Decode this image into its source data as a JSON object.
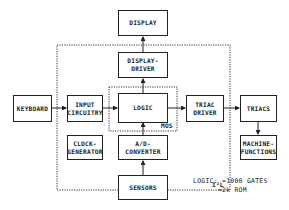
{
  "diagram": {
    "blocks": {
      "display": {
        "lines": [
          "DISPLAY"
        ]
      },
      "display_driver": {
        "lines": [
          "DISPLAY-",
          "DRIVER"
        ]
      },
      "keyboard": {
        "lines": [
          "KEYBOARD"
        ]
      },
      "input_circuitry": {
        "lines": [
          "INPUT",
          "CIRCUITRY"
        ]
      },
      "logic": {
        "lines": [
          "LOGIC"
        ]
      },
      "triac_driver": {
        "lines": [
          "TRIAC",
          "DRIVER"
        ]
      },
      "triacs": {
        "lines": [
          "TRIACS"
        ]
      },
      "clock_generator": {
        "lines": [
          "CLOCK-",
          "GENERATOR"
        ]
      },
      "ad_converter": {
        "lines": [
          "A/D-",
          "CONVERTER"
        ]
      },
      "machine_functions": {
        "lines": [
          "MACHINE-",
          "FUNCTIONS"
        ]
      },
      "sensors": {
        "lines": [
          "SENSORS"
        ]
      }
    },
    "regions": {
      "mos": {
        "label": "MOS"
      },
      "i2l": {
        "label": "I²L"
      }
    },
    "notes": {
      "line1": "LOGIC: ≈1000 GATES",
      "line2": "      ≈2k ROM"
    },
    "connections": [
      {
        "from": "display_driver",
        "to": "display"
      },
      {
        "from": "logic",
        "to": "display_driver"
      },
      {
        "from": "keyboard",
        "to": "input_circuitry"
      },
      {
        "from": "input_circuitry",
        "to": "logic"
      },
      {
        "from": "logic",
        "to": "triac_driver"
      },
      {
        "from": "triac_driver",
        "to": "triacs"
      },
      {
        "from": "triacs",
        "to": "machine_functions"
      },
      {
        "from": "ad_converter",
        "to": "logic"
      },
      {
        "from": "sensors",
        "to": "ad_converter"
      }
    ],
    "colors": {
      "line": "#222222",
      "background": "#ffffff"
    }
  }
}
